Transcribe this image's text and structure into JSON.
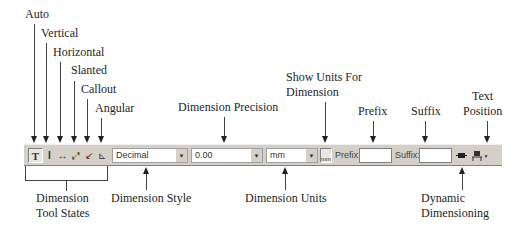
{
  "callouts_top": {
    "auto": "Auto",
    "vertical": "Vertical",
    "horizontal": "Horizontal",
    "slanted": "Slanted",
    "callout": "Callout",
    "angular": "Angular",
    "dimension_precision": "Dimension Precision",
    "show_units_line1": "Show Units For",
    "show_units_line2": "Dimension",
    "prefix": "Prefix",
    "suffix": "Suffix",
    "text_position_line1": "Text",
    "text_position_line2": "Position"
  },
  "callouts_bottom": {
    "tool_states_line1": "Dimension",
    "tool_states_line2": "Tool States",
    "dimension_style": "Dimension Style",
    "dimension_units": "Dimension Units",
    "dynamic_line1": "Dynamic",
    "dynamic_line2": "Dimensioning"
  },
  "toolbar": {
    "tool_icons": {
      "auto": "T",
      "vertical": "I",
      "horizontal": "↔",
      "slanted": "⤢",
      "callout": "↙",
      "angular": "⊾"
    },
    "style_value": "Decimal",
    "precision_value": "0.00",
    "units_value": "mm",
    "show_units_icon": "mm",
    "prefix_label": "Prefix:",
    "prefix_value": "",
    "suffix_label": "Suffix:",
    "suffix_value": "",
    "dropdown_glyph": "▼"
  }
}
